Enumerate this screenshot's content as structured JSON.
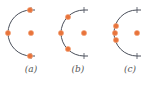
{
  "colors": {
    "arc": "#4a4f5a",
    "dot": "#e8743b",
    "dot_stroke": "#f3a37a",
    "label": "#555555"
  },
  "panels": [
    {
      "label": "(a)",
      "center": [
        31,
        33
      ],
      "radius": 23,
      "dots": [
        [
          30,
          10
        ],
        [
          8,
          33
        ],
        [
          30,
          56
        ]
      ],
      "cx": 31
    },
    {
      "label": "(b)",
      "center": [
        84,
        33
      ],
      "radius": 23,
      "dots": [
        [
          68,
          17
        ],
        [
          61,
          33
        ],
        [
          68,
          49
        ]
      ],
      "cx": 84
    },
    {
      "label": "(c)",
      "center": [
        137,
        33
      ],
      "radius": 23,
      "dots": [
        [
          116,
          26
        ],
        [
          115,
          33
        ],
        [
          116,
          40
        ]
      ],
      "cx": 137
    }
  ]
}
